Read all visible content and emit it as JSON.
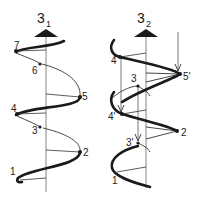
{
  "diagram": {
    "left_helix": {
      "title_main": "3",
      "title_sub": "1",
      "points": [
        {
          "label": "1"
        },
        {
          "label": "2"
        },
        {
          "label": "3"
        },
        {
          "label": "4"
        },
        {
          "label": "5"
        },
        {
          "label": "6"
        },
        {
          "label": "7"
        }
      ]
    },
    "right_helix": {
      "title_main": "3",
      "title_sub": "2",
      "points": [
        {
          "label": "1"
        },
        {
          "label": "2"
        },
        {
          "label": "3'"
        },
        {
          "label": "4'"
        },
        {
          "label": "5'"
        },
        {
          "label": "3"
        },
        {
          "label": "4"
        }
      ]
    },
    "colors": {
      "strand": "#1a1a1a",
      "axis": "#777777",
      "background": "#ffffff"
    }
  }
}
